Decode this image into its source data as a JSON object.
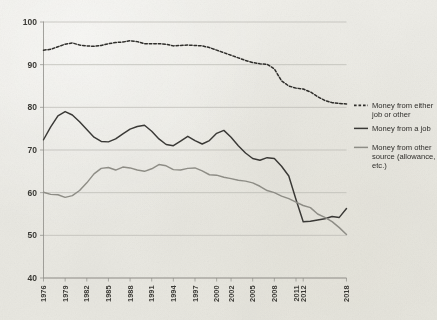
{
  "chart_data": {
    "type": "line",
    "title": "",
    "subtitle": "",
    "xlabel": "",
    "ylabel": "",
    "ylim": [
      40,
      100
    ],
    "yticks": [
      40,
      50,
      60,
      70,
      80,
      90,
      100
    ],
    "grid": true,
    "legend_position": "right",
    "x": [
      1976,
      1977,
      1978,
      1979,
      1980,
      1981,
      1982,
      1983,
      1984,
      1985,
      1986,
      1987,
      1988,
      1989,
      1990,
      1991,
      1992,
      1993,
      1994,
      1995,
      1996,
      1997,
      1998,
      1999,
      2000,
      2001,
      2002,
      2003,
      2004,
      2005,
      2006,
      2007,
      2008,
      2009,
      2010,
      2011,
      2012,
      2013,
      2014,
      2015,
      2016,
      2017,
      2018
    ],
    "xtick_labels": [
      "1976",
      "1979",
      "1982",
      "1985",
      "1988",
      "1991",
      "1994",
      "1997",
      "2000",
      "2002",
      "2005",
      "2008",
      "2011",
      "2012",
      "2018"
    ],
    "xtick_values": [
      1976,
      1979,
      1982,
      1985,
      1988,
      1991,
      1994,
      1997,
      2000,
      2002,
      2005,
      2008,
      2011,
      2012,
      2018
    ],
    "series": [
      {
        "name": "Money from either job or other",
        "style": "dashed",
        "color": "#2f2e2b",
        "values": [
          93.4,
          93.6,
          94.2,
          94.8,
          95.1,
          94.6,
          94.4,
          94.3,
          94.5,
          94.9,
          95.2,
          95.3,
          95.6,
          95.4,
          94.9,
          94.9,
          94.9,
          94.8,
          94.4,
          94.5,
          94.6,
          94.5,
          94.4,
          94.0,
          93.4,
          92.8,
          92.2,
          91.6,
          91.0,
          90.5,
          90.2,
          90.1,
          89.0,
          86.2,
          85.0,
          84.5,
          84.3,
          83.6,
          82.5,
          81.6,
          81.1,
          80.9,
          80.8
        ]
      },
      {
        "name": "Money from a job",
        "style": "solid",
        "color": "#3a3936",
        "values": [
          72.4,
          75.4,
          78.0,
          79.0,
          78.2,
          76.6,
          74.8,
          73.0,
          72.0,
          71.9,
          72.6,
          73.8,
          74.9,
          75.5,
          75.8,
          74.4,
          72.6,
          71.3,
          71.0,
          72.1,
          73.2,
          72.2,
          71.4,
          72.2,
          73.9,
          74.6,
          73.0,
          71.0,
          69.3,
          68.0,
          67.6,
          68.2,
          68.0,
          66.2,
          63.9,
          58.4,
          53.2,
          53.3,
          53.6,
          53.9,
          54.4,
          54.2,
          56.3
        ]
      },
      {
        "name": "Money from other source (allowance, etc.)",
        "style": "solid",
        "color": "#8e8d86",
        "values": [
          60.1,
          59.6,
          59.5,
          58.9,
          59.3,
          60.5,
          62.3,
          64.4,
          65.7,
          65.9,
          65.3,
          66.0,
          65.8,
          65.3,
          65.0,
          65.6,
          66.6,
          66.3,
          65.4,
          65.3,
          65.7,
          65.8,
          65.1,
          64.2,
          64.1,
          63.6,
          63.3,
          62.9,
          62.7,
          62.3,
          61.5,
          60.5,
          60.0,
          59.2,
          58.6,
          57.8,
          57.0,
          56.5,
          55.0,
          54.2,
          53.2,
          51.8,
          50.2
        ]
      }
    ],
    "legend": [
      {
        "label": "Money from either job or other",
        "style": "dashed",
        "color": "#2f2e2b"
      },
      {
        "label": "Money from a job",
        "style": "solid",
        "color": "#3a3936"
      },
      {
        "label": "Money from other source (allowance, etc.)",
        "style": "solid",
        "color": "#8e8d86"
      }
    ]
  }
}
